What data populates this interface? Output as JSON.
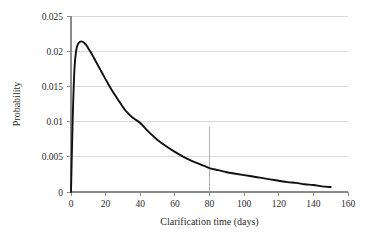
{
  "chart_data": {
    "type": "line",
    "title": "",
    "subtitle": "",
    "xlabel": "Clarification time (days)",
    "ylabel": "Probability",
    "xlim": [
      0,
      160
    ],
    "ylim": [
      0,
      0.025
    ],
    "xticks": [
      0,
      20,
      40,
      60,
      80,
      100,
      120,
      140,
      160
    ],
    "xtick_labels": [
      "0",
      "20",
      "40",
      "60",
      "80",
      "100",
      "120",
      "140",
      "160"
    ],
    "yticks": [
      0,
      0.005,
      0.01,
      0.015,
      0.02,
      0.025
    ],
    "ytick_labels": [
      "0",
      "0.005",
      "0.01",
      "0.015",
      "0.02",
      "0.025"
    ],
    "grid": "horizontal",
    "legend": "none",
    "series": [
      {
        "name": "Probability density of clarification time",
        "color": "#111111",
        "x": [
          0,
          1,
          2,
          3,
          4,
          5,
          6,
          7,
          8,
          9,
          10,
          12,
          14,
          16,
          18,
          20,
          24,
          28,
          32,
          36,
          40,
          45,
          50,
          55,
          60,
          65,
          70,
          75,
          80,
          85,
          90,
          95,
          100,
          105,
          110,
          115,
          120,
          125,
          130,
          135,
          140,
          145,
          150
        ],
        "y": [
          0.0,
          0.0105,
          0.0175,
          0.0201,
          0.021,
          0.0213,
          0.0214,
          0.0213,
          0.0211,
          0.0208,
          0.0204,
          0.0196,
          0.0187,
          0.0178,
          0.0169,
          0.016,
          0.0143,
          0.0128,
          0.0114,
          0.0105,
          0.0098,
          0.0085,
          0.0074,
          0.0065,
          0.0057,
          0.005,
          0.0044,
          0.0039,
          0.0034,
          0.0031,
          0.0028,
          0.0026,
          0.0024,
          0.0022,
          0.002,
          0.0018,
          0.0016,
          0.0014,
          0.0013,
          0.0011,
          0.001,
          0.0008,
          0.0007
        ]
      }
    ],
    "annotations": [
      {
        "name": "vertical-marker",
        "type": "vline",
        "x": 80,
        "y_top": 0.0092,
        "y_bottom": 0,
        "color": "#b0b0b0",
        "label": ""
      }
    ]
  }
}
